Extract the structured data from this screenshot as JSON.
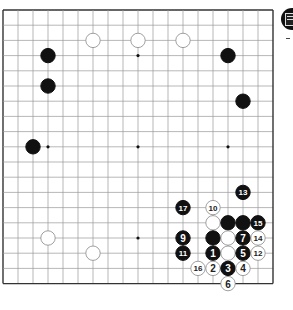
{
  "board": {
    "size": 19,
    "origin_x": 3,
    "origin_y": 10,
    "spacing_x": 15,
    "spacing_y": 15.2,
    "line_color": "#9a9a9a",
    "edge_color": "#333333",
    "hoshi": [
      [
        3,
        3
      ],
      [
        9,
        3
      ],
      [
        15,
        3
      ],
      [
        3,
        9
      ],
      [
        9,
        9
      ],
      [
        15,
        9
      ],
      [
        3,
        15
      ],
      [
        9,
        15
      ],
      [
        15,
        15
      ]
    ]
  },
  "stones": [
    {
      "color": "white",
      "x": 6,
      "y": 2,
      "label": ""
    },
    {
      "color": "white",
      "x": 9,
      "y": 2,
      "label": ""
    },
    {
      "color": "white",
      "x": 12,
      "y": 2,
      "label": ""
    },
    {
      "color": "black",
      "x": 3,
      "y": 3,
      "label": ""
    },
    {
      "color": "black",
      "x": 3,
      "y": 5,
      "label": ""
    },
    {
      "color": "black",
      "x": 15,
      "y": 3,
      "label": ""
    },
    {
      "color": "black",
      "x": 16,
      "y": 6,
      "label": ""
    },
    {
      "color": "black",
      "x": 2,
      "y": 9,
      "label": ""
    },
    {
      "color": "white",
      "x": 3,
      "y": 15,
      "label": ""
    },
    {
      "color": "white",
      "x": 6,
      "y": 16,
      "label": ""
    },
    {
      "color": "black",
      "x": 16,
      "y": 12,
      "label": "13"
    },
    {
      "color": "black",
      "x": 12,
      "y": 13,
      "label": "17"
    },
    {
      "color": "white",
      "x": 14,
      "y": 13,
      "label": "10"
    },
    {
      "color": "white",
      "x": 14,
      "y": 14,
      "label": ""
    },
    {
      "color": "black",
      "x": 15,
      "y": 14,
      "label": ""
    },
    {
      "color": "black",
      "x": 16,
      "y": 14,
      "label": ""
    },
    {
      "color": "black",
      "x": 17,
      "y": 14,
      "label": "15"
    },
    {
      "color": "black",
      "x": 12,
      "y": 15,
      "label": "9"
    },
    {
      "color": "black",
      "x": 14,
      "y": 15,
      "label": ""
    },
    {
      "color": "white",
      "x": 15,
      "y": 15,
      "label": ""
    },
    {
      "color": "black",
      "x": 16,
      "y": 15,
      "label": "7"
    },
    {
      "color": "white",
      "x": 17,
      "y": 15,
      "label": "14"
    },
    {
      "color": "black",
      "x": 12,
      "y": 16,
      "label": "11"
    },
    {
      "color": "black",
      "x": 14,
      "y": 16,
      "label": "1"
    },
    {
      "color": "white",
      "x": 15,
      "y": 16,
      "label": ""
    },
    {
      "color": "black",
      "x": 16,
      "y": 16,
      "label": "5"
    },
    {
      "color": "white",
      "x": 17,
      "y": 16,
      "label": "12"
    },
    {
      "color": "white",
      "x": 13,
      "y": 17,
      "label": "16"
    },
    {
      "color": "white",
      "x": 14,
      "y": 17,
      "label": "2"
    },
    {
      "color": "black",
      "x": 15,
      "y": 17,
      "label": "3"
    },
    {
      "color": "white",
      "x": 16,
      "y": 17,
      "label": "4"
    },
    {
      "color": "white",
      "x": 15,
      "y": 18,
      "label": "6"
    }
  ],
  "side_marker": {
    "icon": "black-stone-badge-icon",
    "color": "#111111"
  }
}
